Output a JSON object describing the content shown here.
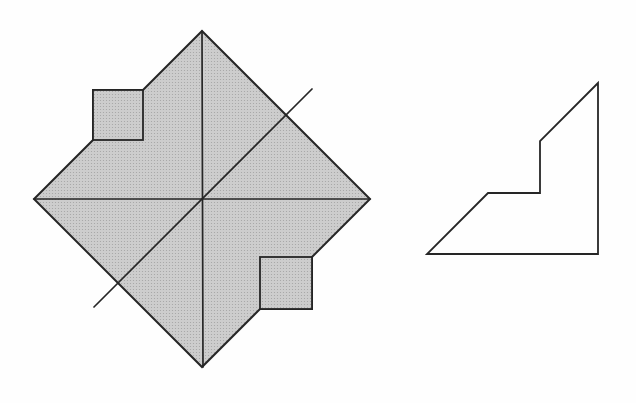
{
  "canvas": {
    "width": 636,
    "height": 403
  },
  "colors": {
    "background": "#fefefe",
    "shade_base": "#cdcdcd",
    "shade_dot": "#a3a3a3",
    "line": "#262626",
    "none": "none"
  },
  "figures": [
    {
      "name": "folded-square-figure",
      "shapes": [
        {
          "shape": "path",
          "name": "shaded-diamond-with-flaps",
          "d": "M202,31 L370,199 L312,257 L312,309 L260,309 L202,367 L34,199 L93,140 L93,90 L143,90 Z",
          "fill": "halftone",
          "stroke": "line",
          "strokeWidth": 2
        },
        {
          "shape": "rect",
          "name": "upper-left-flap-square",
          "x": 93,
          "y": 90,
          "width": 50,
          "height": 50,
          "fill": "halftone",
          "stroke": "line",
          "strokeWidth": 1.8
        },
        {
          "shape": "rect",
          "name": "lower-right-flap-square",
          "x": 260,
          "y": 257,
          "width": 52,
          "height": 52,
          "fill": "halftone",
          "stroke": "line",
          "strokeWidth": 1.8
        },
        {
          "shape": "line",
          "name": "vertical-diagonal-line",
          "x1": 202,
          "y1": 31,
          "x2": 203,
          "y2": 367,
          "fill": "none",
          "stroke": "line",
          "strokeWidth": 1.7
        },
        {
          "shape": "line",
          "name": "horizontal-diagonal-line",
          "x1": 34,
          "y1": 199,
          "x2": 370,
          "y2": 199,
          "fill": "none",
          "stroke": "line",
          "strokeWidth": 1.7
        },
        {
          "shape": "line",
          "name": "oblique-fold-line",
          "x1": 94,
          "y1": 307,
          "x2": 312,
          "y2": 89,
          "fill": "none",
          "stroke": "line",
          "strokeWidth": 1.7
        }
      ]
    },
    {
      "name": "unfolded-piece-figure",
      "shapes": [
        {
          "shape": "polygon",
          "name": "notched-triangle-outline",
          "points": "598,83 540,141 540,193 488,193 427,254 598,254",
          "fill": "none",
          "stroke": "line",
          "strokeWidth": 1.8
        }
      ]
    }
  ]
}
